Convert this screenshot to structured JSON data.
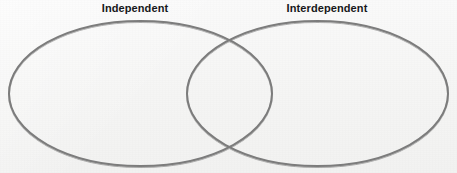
{
  "figure": {
    "type": "venn-diagram",
    "background_color": "#f7f7f6",
    "stroke_color": "#7c7c7c",
    "stroke_width": 2,
    "label_color": "#16171a"
  },
  "labels": {
    "left": "Independent",
    "right": "Interdependent"
  },
  "circles": [
    {
      "name": "independent-ellipse",
      "label": "Independent",
      "cx": 140.5,
      "cy": 93.5,
      "rx": 131.5,
      "ry": 72.5
    },
    {
      "name": "interdependent-ellipse",
      "label": "Interdependent",
      "cx": 317.5,
      "cy": 93.5,
      "rx": 130.5,
      "ry": 72.5
    }
  ],
  "overlap": {
    "name": "shared-region",
    "top_crossing": {
      "x": 233,
      "y": 38
    },
    "bottom_crossing": {
      "x": 233,
      "y": 150
    },
    "left_edge_x": 187,
    "right_edge_x": 272,
    "contents": []
  }
}
